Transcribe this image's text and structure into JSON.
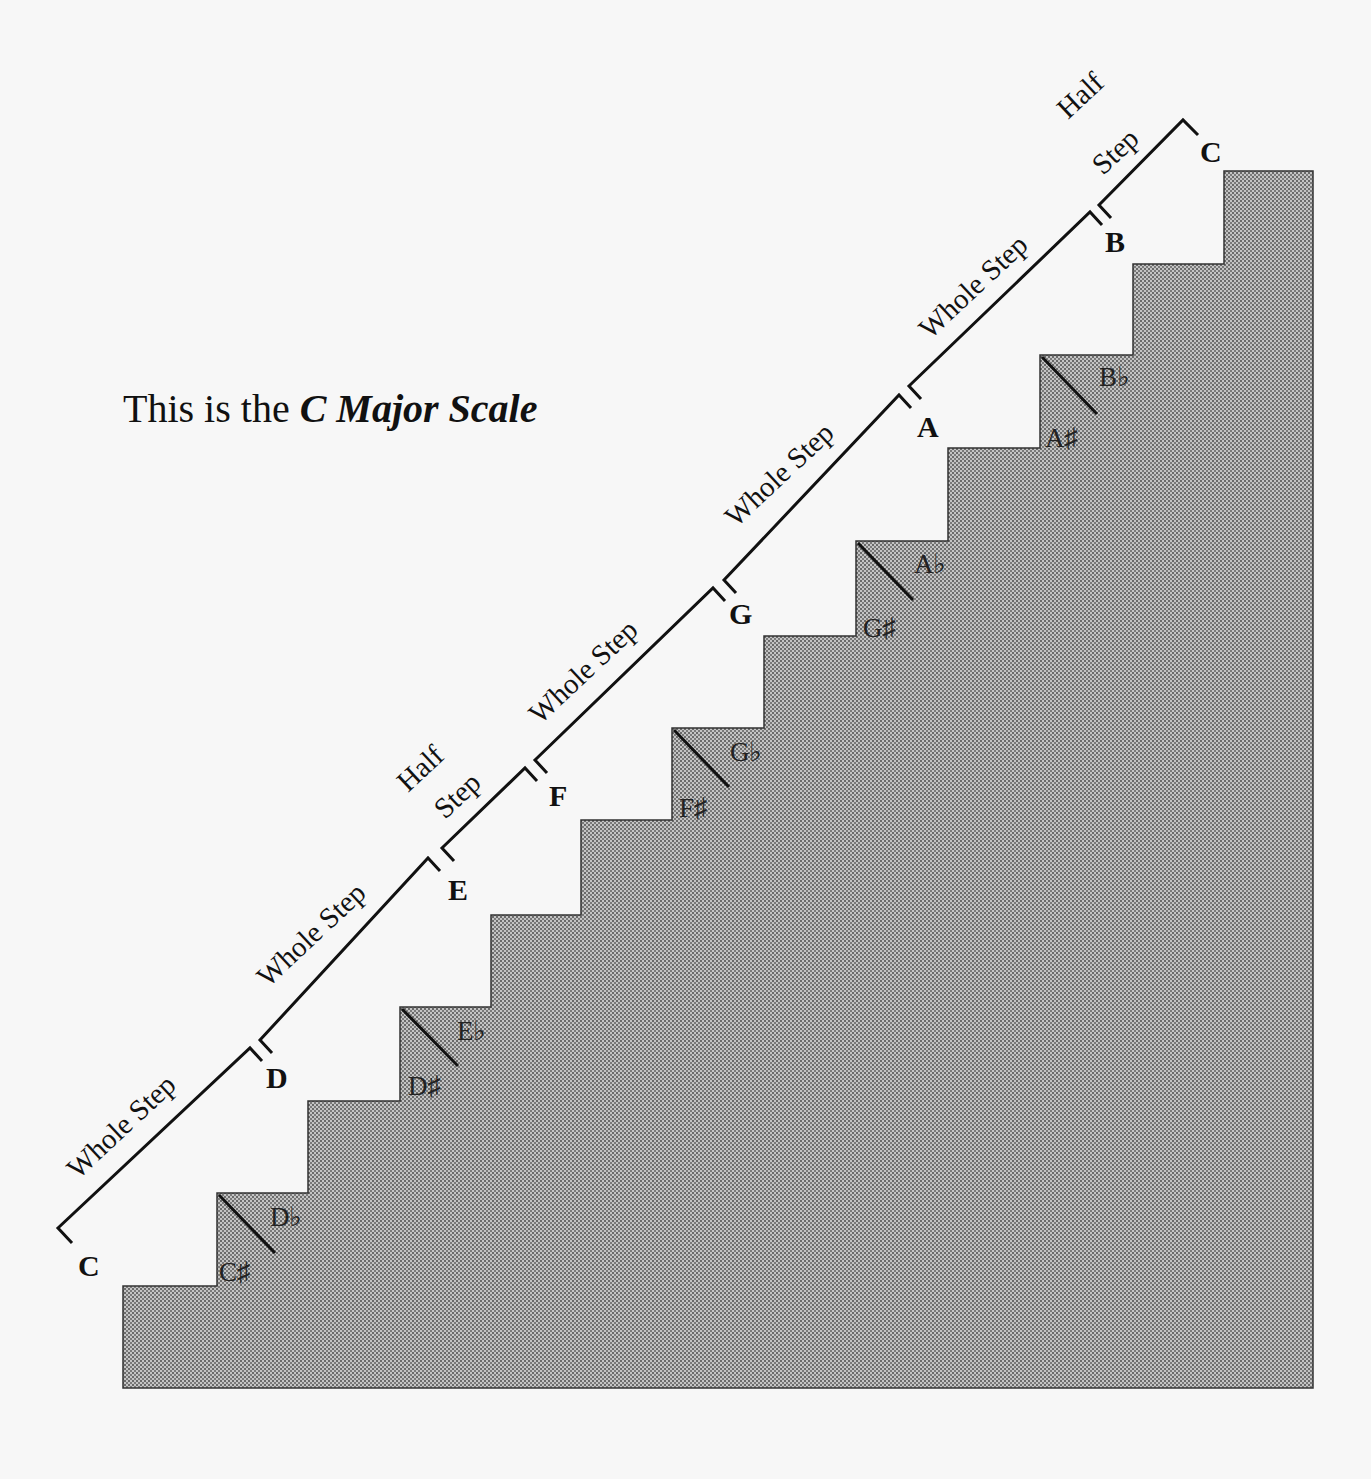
{
  "title": {
    "prefix": "This is the ",
    "emphasis": "C Major Scale"
  },
  "colors": {
    "background": "#f7f7f7",
    "stair_fill": "#b8b8b8",
    "stair_dots": "#5a5a5a",
    "stroke": "#222222"
  },
  "scale_notes": [
    {
      "label": "C",
      "x": 78,
      "y": 1276
    },
    {
      "label": "D",
      "x": 266,
      "y": 1088
    },
    {
      "label": "E",
      "x": 448,
      "y": 900
    },
    {
      "label": "F",
      "x": 549,
      "y": 806
    },
    {
      "label": "G",
      "x": 729,
      "y": 624
    },
    {
      "label": "A",
      "x": 917,
      "y": 437
    },
    {
      "label": "B",
      "x": 1105,
      "y": 252
    },
    {
      "label": "C",
      "x": 1200,
      "y": 162
    }
  ],
  "accidentals": [
    {
      "sharp": "C♯",
      "flat": "D♭",
      "step_x": 217,
      "step_y": 1193
    },
    {
      "sharp": "D♯",
      "flat": "E♭",
      "step_x": 400,
      "step_y": 1007
    },
    {
      "sharp": "F♯",
      "flat": "G♭",
      "step_x": 672,
      "step_y": 728
    },
    {
      "sharp": "G♯",
      "flat": "A♭",
      "step_x": 856,
      "step_y": 541
    },
    {
      "sharp": "A♯",
      "flat": "B♭",
      "step_x": 1040,
      "step_y": 355
    }
  ],
  "intervals": [
    {
      "label": "Whole Step",
      "from": "C",
      "to": "D"
    },
    {
      "label": "Whole Step",
      "from": "D",
      "to": "E"
    },
    {
      "label": "Half Step",
      "from": "E",
      "to": "F"
    },
    {
      "label": "Whole Step",
      "from": "F",
      "to": "G"
    },
    {
      "label": "Whole Step",
      "from": "G",
      "to": "A"
    },
    {
      "label": "Whole Step",
      "from": "A",
      "to": "B"
    },
    {
      "label": "Half Step",
      "from": "B",
      "to": "C"
    }
  ],
  "labels": {
    "whole": "Whole Step",
    "half_line1": "Half",
    "half_line2": "Step"
  }
}
